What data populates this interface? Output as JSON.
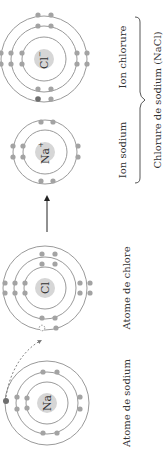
{
  "diagram": {
    "orientation": "rotated-90-ccw",
    "atoms": [
      {
        "id": "na-atom",
        "symbol": "Na",
        "label": "Atome de sodium",
        "shells": [
          2,
          8,
          1
        ]
      },
      {
        "id": "cl-atom",
        "symbol": "Cl",
        "label": "Atome de chlore",
        "shells": [
          2,
          8,
          7
        ]
      },
      {
        "id": "na-ion",
        "symbol": "Na",
        "charge": "+",
        "label": "Ion sodium",
        "shells": [
          2,
          8
        ]
      },
      {
        "id": "cl-ion",
        "symbol": "Cl",
        "charge": "−",
        "label": "Ion chlorure",
        "shells": [
          2,
          8,
          8
        ]
      }
    ],
    "compound_label": "Chlorure de sodium (NaCl)",
    "transfer_arrow": "electron transfer (dashed)",
    "reaction_arrow": "reaction arrow",
    "colors": {
      "electron": "#a3a3a3",
      "transferred_electron": "#6e6e6e",
      "nucleus": "#d6d6d6",
      "orbit": "#9a9a9a",
      "text": "#333333"
    }
  }
}
